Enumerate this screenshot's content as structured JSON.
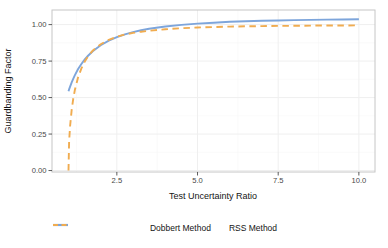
{
  "figure": {
    "background": "#ffffff",
    "panel_border_color": "#c6c6c6",
    "grid_major_color": "#efefef",
    "grid_minor_color": "#f7f7f7",
    "tick_mark_color": "#333333",
    "tick_label_color": "#474747",
    "title_color": "#141414",
    "series_colors": {
      "dobbert": "#7da5db",
      "rss": "#f0ac50"
    }
  },
  "chart_data": {
    "type": "line",
    "title": "",
    "xlabel": "Test Uncertainty Ratio",
    "ylabel": "Guardbanding Factor",
    "xlim": [
      0.49,
      10.5
    ],
    "ylim": [
      -0.01,
      1.1
    ],
    "xticks": [
      2.5,
      5.0,
      7.5,
      10.0
    ],
    "xtick_labels": [
      "2.5",
      "5.0",
      "7.5",
      "10.0"
    ],
    "xticks_minor": [
      1.25,
      3.75,
      6.25,
      8.75
    ],
    "yticks": [
      0.0,
      0.25,
      0.5,
      0.75,
      1.0
    ],
    "ytick_labels": [
      "0.00",
      "0.25",
      "0.50",
      "0.75",
      "1.00"
    ],
    "yticks_minor": [
      0.125,
      0.375,
      0.625,
      0.875
    ],
    "grid": true,
    "legend_position": "bottom",
    "x": [
      1,
      1.02,
      1.05,
      1.1,
      1.15,
      1.2,
      1.3,
      1.4,
      1.5,
      1.6,
      1.75,
      2,
      2.25,
      2.5,
      2.75,
      3,
      3.25,
      3.5,
      4,
      4.5,
      5,
      5.5,
      6,
      6.5,
      7,
      7.5,
      8,
      8.5,
      9,
      9.5,
      10
    ],
    "series": [
      {
        "name": "Dobbert Method",
        "color": "#7da5db",
        "dash": "solid",
        "values": [
          0.543,
          0.556,
          0.575,
          0.604,
          0.63,
          0.654,
          0.695,
          0.73,
          0.76,
          0.785,
          0.818,
          0.859,
          0.89,
          0.914,
          0.933,
          0.948,
          0.961,
          0.971,
          0.987,
          0.998,
          1.007,
          1.013,
          1.019,
          1.023,
          1.026,
          1.028,
          1.031,
          1.032,
          1.034,
          1.035,
          1.036
        ]
      },
      {
        "name": "RSS Method",
        "color": "#f0ac50",
        "dash": "dashed",
        "values": [
          0.0,
          0.197,
          0.305,
          0.417,
          0.494,
          0.553,
          0.639,
          0.7,
          0.745,
          0.781,
          0.821,
          0.866,
          0.896,
          0.917,
          0.932,
          0.943,
          0.951,
          0.958,
          0.968,
          0.975,
          0.98,
          0.983,
          0.986,
          0.988,
          0.99,
          0.991,
          0.992,
          0.993,
          0.994,
          0.994,
          0.995
        ]
      }
    ]
  }
}
